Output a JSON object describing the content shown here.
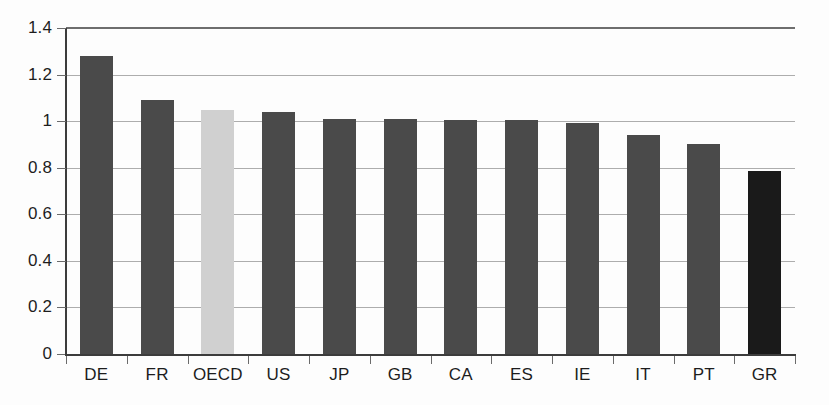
{
  "chart_data": {
    "type": "bar",
    "title": "",
    "subtitle": "",
    "xlabel": "",
    "ylabel": "",
    "categories": [
      "DE",
      "FR",
      "OECD",
      "US",
      "JP",
      "GB",
      "CA",
      "ES",
      "IE",
      "IT",
      "PT",
      "GR"
    ],
    "values": [
      1.28,
      1.09,
      1.05,
      1.04,
      1.01,
      1.01,
      1.005,
      1.005,
      0.99,
      0.94,
      0.9,
      0.785
    ],
    "bar_colors": [
      "#4a4a4a",
      "#4a4a4a",
      "#d0d0d0",
      "#4a4a4a",
      "#4a4a4a",
      "#4a4a4a",
      "#4a4a4a",
      "#4a4a4a",
      "#4a4a4a",
      "#4a4a4a",
      "#4a4a4a",
      "#1a1a1a"
    ],
    "ylim": [
      0,
      1.4
    ],
    "yticks": [
      0,
      0.2,
      0.4,
      0.6,
      0.8,
      1,
      1.2,
      1.4
    ],
    "ytick_labels": [
      "0",
      "0.2",
      "0.4",
      "0.6",
      "0.8",
      "1",
      "1.2",
      "1.4"
    ],
    "grid": true,
    "grid_axis": "y",
    "legend": false,
    "legend_position": "none",
    "annotations": []
  },
  "colors": {
    "bar_default": "#4a4a4a",
    "bar_highlight_light": "#d0d0d0",
    "bar_highlight_dark": "#1a1a1a",
    "axis": "#3c3c3c",
    "grid": "#adadad",
    "text": "#1d1d1d",
    "background": "#fdfdfd"
  }
}
